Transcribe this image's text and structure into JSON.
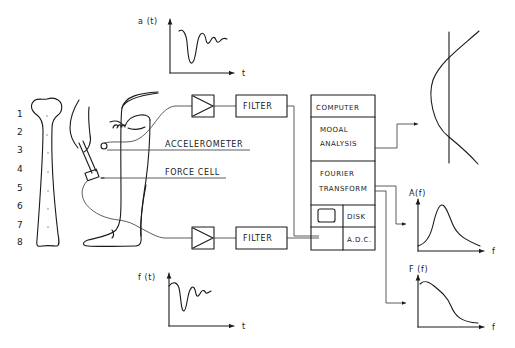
{
  "diagram": {
    "bone_positions": [
      "1",
      "2",
      "3",
      "4",
      "5",
      "6",
      "7",
      "8"
    ],
    "labels": {
      "accelerometer": "ACCELEROMETER",
      "force_cell": "FORCE CELL"
    },
    "signal_chain": {
      "upper": {
        "amplifier": "amplifier",
        "filter": "FILTER"
      },
      "lower": {
        "amplifier": "amplifier",
        "filter": "FILTER"
      }
    },
    "computer_block": {
      "header": "COMPUTER",
      "modal_analysis": [
        "MOOAL",
        "ANALYSIS"
      ],
      "fourier_transform": [
        "FOURIER",
        "TRANSFORM"
      ],
      "disk": "DISK",
      "adc": "A.D.C."
    },
    "plots": {
      "acceleration": {
        "ylabel": "a (t)",
        "xlabel": "t"
      },
      "force": {
        "ylabel": "f (t)",
        "xlabel": "t"
      },
      "response_spectrum": {
        "ylabel": "A(f)",
        "xlabel": "f"
      },
      "force_spectrum": {
        "ylabel": "F (f)",
        "xlabel": "f"
      },
      "mode_shape": {
        "label": ""
      }
    }
  }
}
